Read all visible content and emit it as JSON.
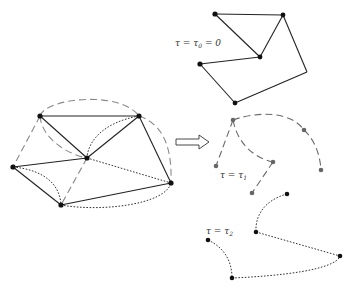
{
  "figure": {
    "arrow_label": "",
    "left_graph": {
      "nodes": [
        {
          "id": "A",
          "x": 40,
          "y": 116
        },
        {
          "id": "B",
          "x": 139,
          "y": 116
        },
        {
          "id": "C",
          "x": 87,
          "y": 158
        },
        {
          "id": "D",
          "x": 13,
          "y": 167
        },
        {
          "id": "E",
          "x": 171,
          "y": 183
        },
        {
          "id": "F",
          "x": 61,
          "y": 205
        }
      ],
      "edge_styles": [
        "solid",
        "dashed",
        "dotted"
      ]
    },
    "panels": [
      {
        "id": "tau0",
        "label_main": "τ = τ",
        "label_sub": "0",
        "label_tail": " = 0",
        "edge_style": "solid"
      },
      {
        "id": "tau1",
        "label_main": "τ = τ",
        "label_sub": "1",
        "label_tail": "",
        "edge_style": "dashed"
      },
      {
        "id": "tau2",
        "label_main": "τ = τ",
        "label_sub": "2",
        "label_tail": "",
        "edge_style": "dotted"
      }
    ],
    "colors": {
      "solid_edge": "#222222",
      "dashed_edge": "#8a8a8a",
      "dotted_edge": "#333333",
      "node_dark": "#111111",
      "node_gray": "#666666"
    }
  }
}
